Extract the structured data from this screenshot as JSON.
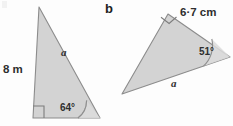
{
  "figure": {
    "type": "geometry-diagram",
    "background_color": "#fdfdfd",
    "fill_color": "#d2d2d2",
    "stroke_color": "#8a8a8a",
    "text_color": "#2b2b2b"
  },
  "parts": [
    {
      "letter": "",
      "name": "triangle-a",
      "shape": "right-angled triangle",
      "vertices": {
        "apex": [
          39,
          7
        ],
        "right_angle": [
          33,
          118
        ],
        "base_right": [
          100,
          118
        ]
      },
      "labels": {
        "vertical_side": "8 m",
        "hypotenuse": "a",
        "angle": "64°"
      },
      "right_angle_marker": true
    },
    {
      "letter": "b",
      "name": "triangle-b",
      "shape": "right-angled triangle",
      "vertices": {
        "top": [
          168,
          14
        ],
        "right": [
          230,
          57
        ],
        "left": [
          122,
          94
        ]
      },
      "labels": {
        "top_side": "6·7 cm",
        "long_side": "a",
        "angle": "51°"
      },
      "right_angle_marker": true
    }
  ]
}
